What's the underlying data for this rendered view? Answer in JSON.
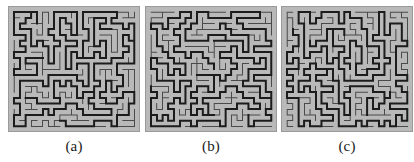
{
  "figure": {
    "width": 414,
    "height": 162,
    "background_color": "#ffffff",
    "panel_count": 3
  },
  "style": {
    "panel_background_color": "#b9b9b9",
    "panel_border_color": "#9a9a9a",
    "thin_line_color": "#4a4a4a",
    "thick_line_color": "#1c1c1c",
    "thin_line_width": 1,
    "thick_line_width": 2,
    "caption_color": "#1a1a1a"
  },
  "panels": [
    {
      "id": "panel-a",
      "caption": "(a)",
      "x": 8,
      "y": 6,
      "width": 132,
      "height": 126,
      "grid_cols": 22,
      "grid_rows": 21,
      "seed": 10427,
      "backbone_fraction": 0.3
    },
    {
      "id": "panel-b",
      "caption": "(b)",
      "x": 145,
      "y": 6,
      "width": 132,
      "height": 126,
      "grid_cols": 22,
      "grid_rows": 21,
      "seed": 58311,
      "backbone_fraction": 0.3
    },
    {
      "id": "panel-c",
      "caption": "(c)",
      "x": 281,
      "y": 6,
      "width": 132,
      "height": 126,
      "grid_cols": 22,
      "grid_rows": 21,
      "seed": 90253,
      "backbone_fraction": 0.3
    }
  ],
  "captions": {
    "a": "(a)",
    "b": "(b)",
    "c": "(c)"
  }
}
